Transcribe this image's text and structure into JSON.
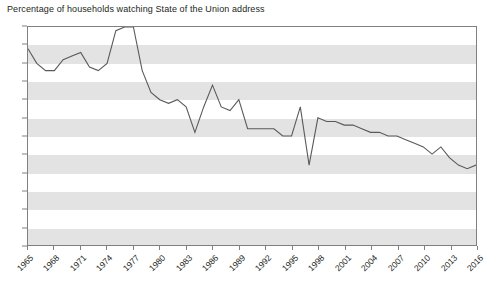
{
  "chart_data": {
    "type": "line",
    "title": "Percentage of households watching State of the Union address",
    "xlabel": "",
    "ylabel": "",
    "ylim": [
      0,
      60
    ],
    "xlim": [
      1965,
      2016
    ],
    "y_ticks": [
      0,
      5,
      10,
      15,
      20,
      25,
      30,
      35,
      40,
      45,
      50,
      55,
      60
    ],
    "x_ticks": [
      1965,
      1968,
      1971,
      1974,
      1977,
      1980,
      1983,
      1986,
      1989,
      1992,
      1995,
      1998,
      2001,
      2004,
      2007,
      2010,
      2013,
      2016
    ],
    "grid": "horizontal-bands",
    "legend": "none",
    "line_color": "#58595b",
    "band_color": "#e3e3e3",
    "x": [
      1965,
      1966,
      1967,
      1968,
      1969,
      1970,
      1971,
      1972,
      1973,
      1974,
      1975,
      1976,
      1977,
      1978,
      1979,
      1980,
      1981,
      1982,
      1983,
      1984,
      1985,
      1986,
      1987,
      1988,
      1989,
      1990,
      1991,
      1992,
      1993,
      1994,
      1995,
      1996,
      1997,
      1998,
      1999,
      2000,
      2001,
      2002,
      2003,
      2004,
      2005,
      2006,
      2007,
      2008,
      2009,
      2010,
      2011,
      2012,
      2013,
      2014,
      2015,
      2016
    ],
    "values": [
      54,
      50,
      48,
      48,
      51,
      52,
      53,
      49,
      48,
      50,
      59,
      60,
      60,
      48,
      42,
      40,
      39,
      40,
      38,
      31,
      38,
      44,
      38,
      37,
      40,
      32,
      32,
      32,
      32,
      30,
      30,
      38,
      22,
      35,
      34,
      34,
      33,
      33,
      32,
      31,
      31,
      30,
      30,
      29,
      28,
      27,
      25,
      27,
      24,
      22,
      21,
      22
    ],
    "series_name": "Percentage of households"
  }
}
